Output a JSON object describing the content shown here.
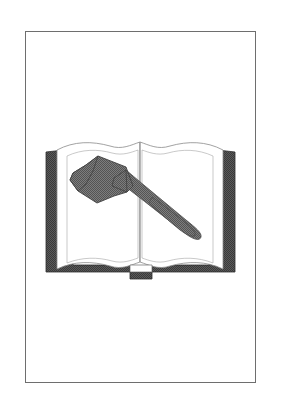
{
  "page": {
    "background_color": "#ffffff",
    "width": 281,
    "height": 413
  },
  "frame": {
    "border_color": "#6e6e6e",
    "fill_color": "#ffffff",
    "x": 25,
    "y": 31,
    "width": 231,
    "height": 352
  },
  "illustration": {
    "name": "open-book-with-gavel",
    "caption": "Open book with gavel",
    "style": "black and white clip art with halftone shading",
    "colors": {
      "book_cover": "#4a4a4a",
      "book_cover_shade": "#5f5f5f",
      "page_fill": "#ffffff",
      "page_outline": "#8a8a8a",
      "gavel_fill": "#6e6e6e",
      "gavel_outline": "#4a4a4a"
    },
    "parts": [
      {
        "name": "book-cover",
        "label": "Book cover"
      },
      {
        "name": "book-left-page",
        "label": "Left page"
      },
      {
        "name": "book-right-page",
        "label": "Right page"
      },
      {
        "name": "book-spine",
        "label": "Book spine"
      },
      {
        "name": "gavel-head",
        "label": "Gavel head"
      },
      {
        "name": "gavel-handle",
        "label": "Gavel handle"
      }
    ]
  }
}
